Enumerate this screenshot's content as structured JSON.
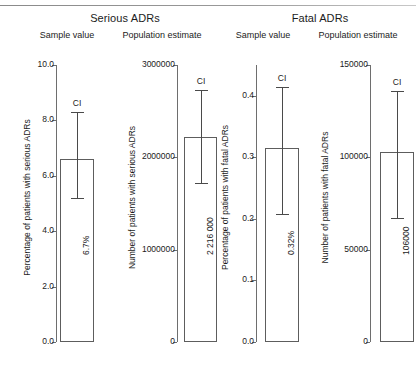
{
  "figure": {
    "groups": [
      {
        "title": "Serious ADRs",
        "sub_left": "Sample value",
        "sub_right": "Population estimate"
      },
      {
        "title": "Fatal ADRs",
        "sub_left": "Sample value",
        "sub_right": "Population estimate"
      }
    ]
  },
  "chart_data": {
    "type": "bar",
    "grid": false,
    "legend": null,
    "panels": [
      {
        "id": "serious-sample",
        "group": "Serious ADRs",
        "column": "Sample value",
        "ylabel": "Percentage of patients with serious ADRs",
        "ylim": [
          0.0,
          10.0
        ],
        "yticks": [
          0.0,
          2.0,
          4.0,
          6.0,
          8.0,
          10.0
        ],
        "ytick_labels": [
          "0.0",
          "2.0",
          "4.0",
          "6.0",
          "8.0",
          "10.0"
        ],
        "categories": [
          "Serious ADRs"
        ],
        "values": [
          6.6
        ],
        "value_label": "6.7%",
        "ci_label": "CI",
        "ci_low": [
          5.2
        ],
        "ci_high": [
          8.3
        ]
      },
      {
        "id": "serious-population",
        "group": "Serious ADRs",
        "column": "Population estimate",
        "ylabel": "Number of patients with serious ADRs",
        "ylim": [
          0,
          3000000
        ],
        "yticks": [
          0,
          1000000,
          2000000,
          3000000
        ],
        "ytick_labels": [
          "0",
          "1000000",
          "2000000",
          "3000000"
        ],
        "categories": [
          "Serious ADRs"
        ],
        "values": [
          2216000
        ],
        "value_label": "2 216 000",
        "ci_label": "CI",
        "ci_low": [
          1721000
        ],
        "ci_high": [
          2733000
        ]
      },
      {
        "id": "fatal-sample",
        "group": "Fatal ADRs",
        "column": "Sample value",
        "ylabel": "Percentage of patients with fatal ADRs",
        "ylim": [
          0.0,
          0.45
        ],
        "yticks": [
          0.0,
          0.1,
          0.2,
          0.3,
          0.4
        ],
        "ytick_labels": [
          "0.0",
          "0.1",
          "0.2",
          "0.3",
          "0.4"
        ],
        "categories": [
          "Fatal ADRs"
        ],
        "values": [
          0.315
        ],
        "value_label": "0.32%",
        "ci_label": "CI",
        "ci_low": [
          0.208
        ],
        "ci_high": [
          0.415
        ]
      },
      {
        "id": "fatal-population",
        "group": "Fatal ADRs",
        "column": "Population estimate",
        "ylabel": "Number of patients with fatal ADRs",
        "ylim": [
          0,
          150000
        ],
        "yticks": [
          0,
          50000,
          100000,
          150000
        ],
        "ytick_labels": [
          "0",
          "50000",
          "100000",
          "150000"
        ],
        "categories": [
          "Fatal ADRs"
        ],
        "values": [
          103000
        ],
        "value_label": "106000",
        "ci_label": "CI",
        "ci_low": [
          67000
        ],
        "ci_high": [
          136000
        ]
      }
    ]
  }
}
